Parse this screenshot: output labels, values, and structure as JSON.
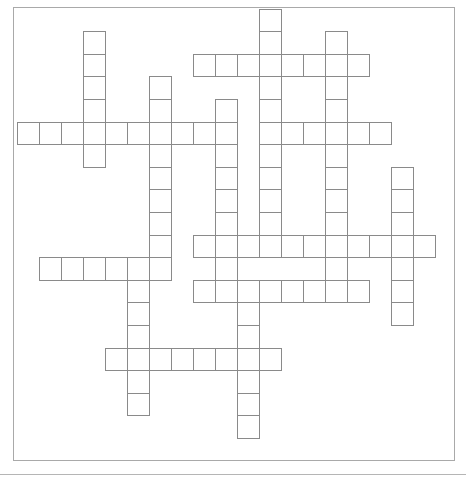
{
  "puzzle": {
    "type": "crossword",
    "grid_origin": {
      "x": 17,
      "y": 8
    },
    "cell_width": 22,
    "cell_height": 22.6,
    "row_offset_y": 0.6,
    "colors": {
      "cell_border": "#8a8a8a",
      "frame_border": "#a9a9a9",
      "background": "#ffffff"
    },
    "words": [
      {
        "id": 1,
        "dir": "down",
        "col": 3,
        "row": 1,
        "length": 6
      },
      {
        "id": 2,
        "dir": "down",
        "col": 11,
        "row": 0,
        "length": 11
      },
      {
        "id": 3,
        "dir": "across",
        "col": 8,
        "row": 2,
        "length": 8
      },
      {
        "id": 4,
        "dir": "down",
        "col": 14,
        "row": 1,
        "length": 12
      },
      {
        "id": 5,
        "dir": "down",
        "col": 6,
        "row": 3,
        "length": 9
      },
      {
        "id": 6,
        "dir": "down",
        "col": 9,
        "row": 4,
        "length": 9
      },
      {
        "id": 7,
        "dir": "across",
        "col": 0,
        "row": 5,
        "length": 10
      },
      {
        "id": 8,
        "dir": "across",
        "col": 11,
        "row": 5,
        "length": 6
      },
      {
        "id": 9,
        "dir": "down",
        "col": 17,
        "row": 7,
        "length": 7
      },
      {
        "id": 10,
        "dir": "across",
        "col": 8,
        "row": 10,
        "length": 11
      },
      {
        "id": 11,
        "dir": "across",
        "col": 1,
        "row": 11,
        "length": 6
      },
      {
        "id": 12,
        "dir": "across",
        "col": 8,
        "row": 12,
        "length": 8
      },
      {
        "id": 13,
        "dir": "down",
        "col": 5,
        "row": 11,
        "length": 7
      },
      {
        "id": 14,
        "dir": "down",
        "col": 10,
        "row": 12,
        "length": 7
      },
      {
        "id": 15,
        "dir": "across",
        "col": 4,
        "row": 15,
        "length": 8
      }
    ]
  }
}
